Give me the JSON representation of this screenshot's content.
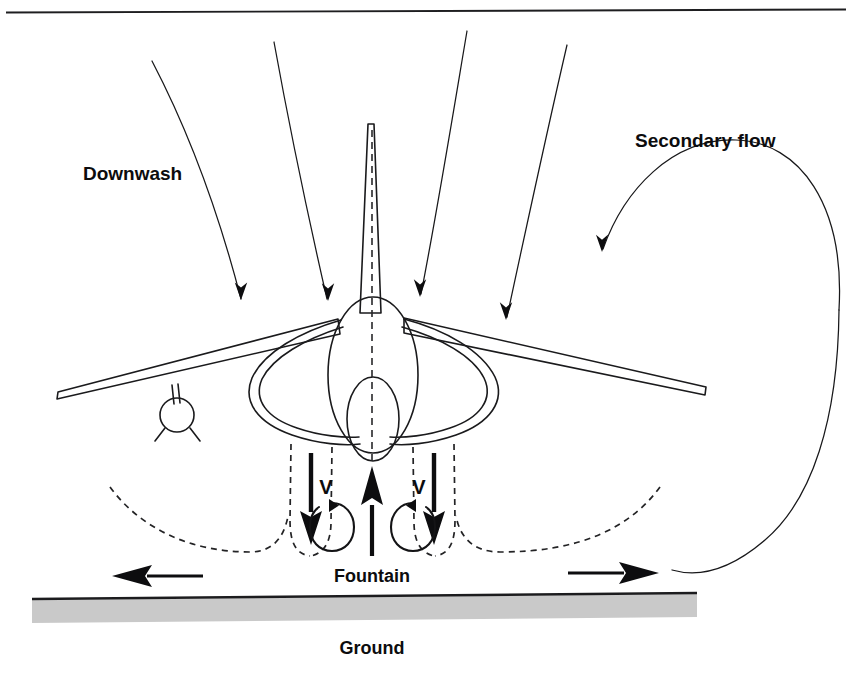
{
  "figure": {
    "background_color": "#ffffff",
    "ink_color": "#0d0d0f",
    "ground_color": "#c9c9c9"
  },
  "labels": {
    "downwash": "Downwash",
    "secondary_flow": "Secondary flow",
    "fountain": "Fountain",
    "ground": "Ground",
    "vortex_left": "V",
    "vortex_right": "V"
  },
  "elements": {
    "top_rule": "horizontal-rule",
    "aircraft": "harrier-front-view",
    "tail_fin": "vertical-tail-fin",
    "fuselage": "fuselage-ellipse",
    "nose": "nose-radome-ellipse",
    "wing_left": "left-wing",
    "wing_right": "right-wing",
    "intake_left": "left-intake-duct",
    "intake_right": "right-intake-duct",
    "outrigger_pod": "left-outrigger-landing-gear",
    "centerline": "aircraft-centerline-dashed",
    "downwash_streamlines": 4,
    "secondary_flow_loop": "secondary-flow-recirculation-loop",
    "jet_boundaries": 4,
    "wall_jet_boundaries": 2,
    "jet_arrows": 2,
    "fountain_arrow": "fountain-upflow-arrow",
    "vortices": 2,
    "ground_arrows": 2,
    "ground_band": "ground-surface"
  }
}
